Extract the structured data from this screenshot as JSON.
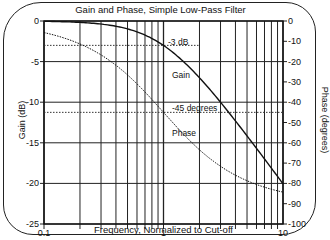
{
  "chart_data": {
    "type": "line",
    "title": "Gain and Phase, Simple Low-Pass Filter",
    "xlabel": "Frequency, Normalized to Cut-off",
    "ylabel": "Gain (dB)",
    "ylabel_right": "Phase (degrees)",
    "xscale": "log",
    "xlim": [
      0.1,
      10
    ],
    "ylim": [
      -25,
      0
    ],
    "ylim_right": [
      -100,
      0
    ],
    "x_ticks": [
      "0.1",
      "1",
      "10"
    ],
    "y_ticks": [
      "0",
      "-5",
      "-10",
      "-15",
      "-20",
      "-25"
    ],
    "y_ticks_right": [
      "0",
      "-10",
      "-20",
      "-30",
      "-40",
      "-50",
      "-60",
      "-70",
      "-80",
      "-90",
      "-100"
    ],
    "grid": true,
    "x": [
      0.1,
      0.2,
      0.3,
      0.5,
      0.7,
      1,
      1.5,
      2,
      3,
      5,
      7,
      10
    ],
    "series": [
      {
        "name": "Gain",
        "axis": "left",
        "style": "solid",
        "values": [
          -0.04,
          -0.17,
          -0.37,
          -0.97,
          -1.71,
          -3.01,
          -5.12,
          -6.99,
          -10.0,
          -14.15,
          -16.99,
          -20.04
        ]
      },
      {
        "name": "Phase",
        "axis": "right",
        "style": "dotted",
        "values": [
          -5.7,
          -11.3,
          -16.7,
          -26.6,
          -35.0,
          -45.0,
          -56.3,
          -63.4,
          -71.6,
          -78.7,
          -81.9,
          -84.3
        ]
      }
    ],
    "annotations": [
      {
        "text": "-3 dB",
        "type": "hline",
        "axis": "left",
        "value": -3
      },
      {
        "text": "-45 degrees",
        "type": "hline",
        "axis": "right",
        "value": -45
      },
      {
        "text": "Gain",
        "type": "label"
      },
      {
        "text": "Phase",
        "type": "label"
      }
    ],
    "legend": "none (inline labels)"
  }
}
